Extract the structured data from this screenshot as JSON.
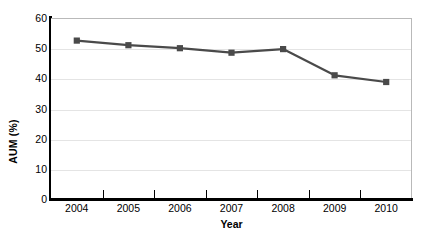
{
  "chart_data": {
    "type": "line",
    "title": "",
    "xlabel": "Year",
    "ylabel": "AUM (%)",
    "categories": [
      "2004",
      "2005",
      "2006",
      "2007",
      "2008",
      "2009",
      "2010"
    ],
    "values": [
      52.5,
      51.0,
      50.0,
      48.5,
      49.7,
      41.0,
      38.8
    ],
    "series": [
      {
        "name": "AUM",
        "values": [
          52.5,
          51.0,
          50.0,
          48.5,
          49.7,
          41.0,
          38.8
        ]
      }
    ],
    "ylim": [
      0,
      60
    ],
    "ytick_labels": [
      "0",
      "10",
      "20",
      "30",
      "40",
      "50",
      "60"
    ],
    "ytick_values": [
      0,
      10,
      20,
      30,
      40,
      50,
      60
    ],
    "grid": true,
    "grid_axis": "y",
    "legend": "none",
    "marker": "square",
    "line_color": "#4a4a4a",
    "marker_color": "#4a4a4a",
    "grid_color": "#e4e4e4",
    "axis_color": "#000000",
    "plot_border_color": "#b9b9b9",
    "background_color": "#ffffff"
  },
  "axes": {
    "y_title": "AUM (%)",
    "x_title": "Year"
  }
}
